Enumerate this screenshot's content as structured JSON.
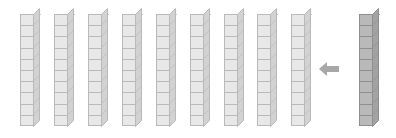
{
  "scene": {
    "title": "Base ten rods regrouping illustration",
    "background_color": "#ffffff",
    "width": 396,
    "height": 138
  },
  "manipulative": {
    "kind": "base-ten-rod",
    "units_per_rod": 10,
    "segment_count": 10
  },
  "groups": [
    {
      "name": "left-group",
      "label": "nine tens rods",
      "count": 9,
      "total_value": 90,
      "fill_color": "#e8e8e8",
      "edge_color": "#b9b9b9",
      "top_color": "#f4f4f4",
      "side_color": "#d2d2d2"
    },
    {
      "name": "right-group",
      "label": "one tens rod",
      "count": 1,
      "total_value": 10,
      "fill_color": "#b9b9b9",
      "edge_color": "#8f8f8f",
      "top_color": "#d8d8d8",
      "side_color": "#a3a3a3"
    }
  ],
  "rods": [
    {
      "id": "rod-1",
      "index": 1,
      "group": "left-group",
      "x": 20,
      "y": 14,
      "width": 14,
      "height": 112,
      "value": 10,
      "shade": "light"
    },
    {
      "id": "rod-2",
      "index": 2,
      "group": "left-group",
      "x": 54,
      "y": 14,
      "width": 14,
      "height": 112,
      "value": 10,
      "shade": "light"
    },
    {
      "id": "rod-3",
      "index": 3,
      "group": "left-group",
      "x": 88,
      "y": 14,
      "width": 14,
      "height": 112,
      "value": 10,
      "shade": "light"
    },
    {
      "id": "rod-4",
      "index": 4,
      "group": "left-group",
      "x": 122,
      "y": 14,
      "width": 14,
      "height": 112,
      "value": 10,
      "shade": "light"
    },
    {
      "id": "rod-5",
      "index": 5,
      "group": "left-group",
      "x": 156,
      "y": 14,
      "width": 14,
      "height": 112,
      "value": 10,
      "shade": "light"
    },
    {
      "id": "rod-6",
      "index": 6,
      "group": "left-group",
      "x": 190,
      "y": 14,
      "width": 14,
      "height": 112,
      "value": 10,
      "shade": "light"
    },
    {
      "id": "rod-7",
      "index": 7,
      "group": "left-group",
      "x": 224,
      "y": 14,
      "width": 14,
      "height": 112,
      "value": 10,
      "shade": "light"
    },
    {
      "id": "rod-8",
      "index": 8,
      "group": "left-group",
      "x": 257,
      "y": 14,
      "width": 14,
      "height": 112,
      "value": 10,
      "shade": "light"
    },
    {
      "id": "rod-9",
      "index": 9,
      "group": "left-group",
      "x": 291,
      "y": 14,
      "width": 14,
      "height": 112,
      "value": 10,
      "shade": "light"
    },
    {
      "id": "rod-10",
      "index": 10,
      "group": "right-group",
      "x": 359,
      "y": 14,
      "width": 14,
      "height": 112,
      "value": 10,
      "shade": "dark"
    }
  ],
  "arrow": {
    "name": "move-left-arrow",
    "direction": "left",
    "color": "#a8a8a8",
    "x": 319,
    "y": 61,
    "width": 20,
    "height": 16
  }
}
